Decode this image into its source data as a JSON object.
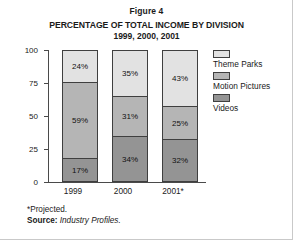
{
  "figure": {
    "label": "Figure 4",
    "title": "PERCENTAGE OF TOTAL INCOME BY DIVISION",
    "subtitle": "1999, 2000, 2001"
  },
  "notes": {
    "projected": "*Projected.",
    "source_label": "Source:",
    "source_value": "Industry Profiles."
  },
  "chart_data": {
    "type": "bar",
    "subtype": "stacked-column-100",
    "title": "PERCENTAGE OF TOTAL INCOME BY DIVISION",
    "subtitle": "1999, 2000, 2001",
    "xlabel": "",
    "ylabel": "",
    "categories": [
      "1999",
      "2000",
      "2001*"
    ],
    "ylim": [
      0,
      100
    ],
    "yticks": [
      "0",
      "25",
      "50",
      "75",
      "100"
    ],
    "ytick_values": [
      0,
      25,
      50,
      75,
      100
    ],
    "grid": false,
    "legend_position": "right",
    "series": [
      {
        "name": "Theme Parks",
        "color": "#e2e2e2",
        "values": [
          24,
          35,
          43
        ],
        "labels": [
          "24%",
          "35%",
          "43%"
        ]
      },
      {
        "name": "Motion Pictures",
        "color": "#b5b5b5",
        "values": [
          59,
          31,
          25
        ],
        "labels": [
          "59%",
          "31%",
          "25%"
        ]
      },
      {
        "name": "Videos",
        "color": "#949494",
        "values": [
          17,
          34,
          32
        ],
        "labels": [
          "17%",
          "34%",
          "32%"
        ]
      }
    ]
  }
}
